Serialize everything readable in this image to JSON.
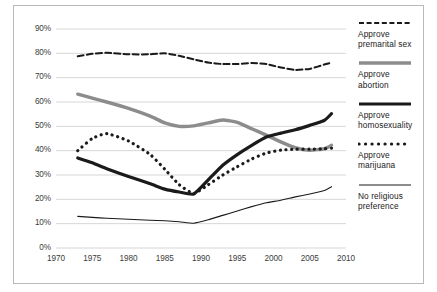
{
  "chart_data": {
    "type": "line",
    "title": "",
    "subtitle": "",
    "xlabel": "",
    "ylabel": "",
    "xlim": [
      1970,
      2010
    ],
    "ylim": [
      0,
      0.9
    ],
    "grid": true,
    "grid_axis": "y",
    "legend_position": "right",
    "xticks": [
      "1970",
      "1975",
      "1980",
      "1985",
      "1990",
      "1995",
      "2000",
      "2005",
      "2010"
    ],
    "xtick_values": [
      1970,
      1975,
      1980,
      1985,
      1990,
      1995,
      2000,
      2005,
      2010
    ],
    "yticks": [
      "0%",
      "10%",
      "20%",
      "30%",
      "40%",
      "50%",
      "60%",
      "70%",
      "80%",
      "90%"
    ],
    "ytick_values": [
      0,
      10,
      20,
      30,
      40,
      50,
      60,
      70,
      80,
      90
    ],
    "series": [
      {
        "name": "Approve premarital sex",
        "style": "dashed",
        "color": "#1a1a1a",
        "width": 2.0,
        "x": [
          1973,
          1975,
          1977,
          1980,
          1983,
          1985,
          1987,
          1989,
          1991,
          1993,
          1995,
          1997,
          1999,
          2001,
          2003,
          2005,
          2007,
          2008
        ],
        "values": [
          78.8,
          79.8,
          80.2,
          79.6,
          79.6,
          80.0,
          79.0,
          77.5,
          76.2,
          75.6,
          75.6,
          76.0,
          75.6,
          74.2,
          73.2,
          73.6,
          75.4,
          76.2
        ]
      },
      {
        "name": "Approve abortion",
        "style": "solid",
        "color": "#8c8c8c",
        "width": 3.4,
        "x": [
          1973,
          1975,
          1977,
          1980,
          1983,
          1985,
          1987,
          1989,
          1991,
          1993,
          1995,
          1997,
          1999,
          2001,
          2003,
          2005,
          2007,
          2008
        ],
        "values": [
          63.2,
          61.6,
          60.0,
          57.4,
          54.2,
          51.4,
          50.0,
          50.2,
          51.4,
          52.6,
          51.6,
          49.0,
          46.4,
          43.6,
          41.2,
          40.2,
          40.8,
          42.2
        ]
      },
      {
        "name": "Approve homosexuality",
        "style": "solid",
        "color": "#1a1a1a",
        "width": 3.2,
        "x": [
          1973,
          1975,
          1977,
          1980,
          1983,
          1985,
          1987,
          1989,
          1991,
          1993,
          1995,
          1997,
          1999,
          2001,
          2003,
          2005,
          2007,
          2008
        ],
        "values": [
          37.0,
          35.0,
          32.6,
          29.4,
          26.4,
          24.2,
          23.0,
          22.2,
          28.0,
          34.0,
          38.4,
          42.2,
          45.6,
          47.2,
          48.6,
          50.4,
          52.4,
          55.2
        ]
      },
      {
        "name": "Approve marijuana",
        "style": "dotted",
        "color": "#1a1a1a",
        "width": 3.2,
        "x": [
          1973,
          1975,
          1977,
          1980,
          1983,
          1985,
          1987,
          1989,
          1991,
          1993,
          1995,
          1997,
          1999,
          2001,
          2003,
          2005,
          2007,
          2008
        ],
        "values": [
          40.0,
          45.0,
          47.0,
          44.0,
          38.4,
          32.4,
          26.0,
          22.4,
          26.0,
          30.0,
          33.4,
          36.6,
          39.0,
          40.2,
          40.6,
          40.6,
          40.8,
          41.0
        ]
      },
      {
        "name": "No religious preference",
        "style": "solid",
        "color": "#1a1a1a",
        "width": 1.1,
        "x": [
          1973,
          1975,
          1977,
          1980,
          1983,
          1985,
          1987,
          1989,
          1991,
          1993,
          1995,
          1997,
          1999,
          2001,
          2003,
          2005,
          2007,
          2008
        ],
        "values": [
          13.0,
          12.6,
          12.2,
          11.8,
          11.4,
          11.2,
          10.8,
          10.2,
          11.6,
          13.4,
          15.2,
          17.0,
          18.6,
          19.6,
          21.0,
          22.2,
          23.6,
          25.2
        ]
      }
    ]
  },
  "legend": {
    "entries": [
      {
        "label": "Approve\npremarital sex",
        "swatch": "dashed-line-swatch"
      },
      {
        "label": "Approve\nabortion",
        "swatch": "gray-thick-line-swatch"
      },
      {
        "label": "Approve\nhomosexuality",
        "swatch": "black-thick-line-swatch"
      },
      {
        "label": "Approve\nmarijuana",
        "swatch": "dotted-line-swatch"
      },
      {
        "label": "No religious\npreference",
        "swatch": "thin-line-swatch"
      }
    ]
  }
}
